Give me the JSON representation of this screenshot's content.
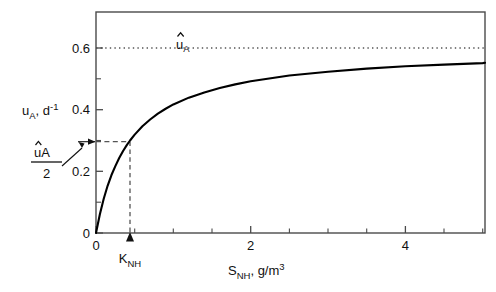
{
  "chart_data": {
    "type": "line",
    "title": "",
    "subtitle": "",
    "xlabel_main": "S",
    "xlabel_sub": "NH",
    "xlabel_rest": ", g/m",
    "xlabel_sup": "3",
    "xlabel_full": "S_NH, g/m^3",
    "ylabel_main": "u",
    "ylabel_sub": "A",
    "ylabel_rest": ", d",
    "ylabel_sup": "-1",
    "ylabel_full": "u_A, d^-1",
    "xlim": [
      0,
      5.03
    ],
    "ylim": [
      0,
      0.717
    ],
    "x_ticks": [
      0,
      2,
      4
    ],
    "x_tick_labels": [
      "0",
      "2",
      "4"
    ],
    "x_minor_ticks": [
      0.5,
      1,
      1.5,
      2.5,
      3,
      3.5,
      4.5,
      5
    ],
    "y_ticks": [
      0,
      0.2,
      0.4,
      0.6
    ],
    "y_tick_labels": [
      "0",
      "0.2",
      "0.4",
      "0.6"
    ],
    "y_minor_ticks": [
      0.1,
      0.3,
      0.5
    ],
    "grid": false,
    "legend": "none",
    "model": "Monod saturation kinetics",
    "equation": "u_A = u_hat_A * S_NH / (K_NH + S_NH)",
    "parameters": {
      "u_hat_A": 0.6,
      "K_NH": 0.44
    },
    "series": [
      {
        "name": "u_A vs S_NH (Monod curve)",
        "style": "solid",
        "color": "#000000",
        "x": [
          0,
          0.05,
          0.1,
          0.15,
          0.2,
          0.25,
          0.3,
          0.35,
          0.4,
          0.44,
          0.5,
          0.6,
          0.7,
          0.8,
          0.9,
          1.0,
          1.2,
          1.4,
          1.6,
          1.8,
          2.0,
          2.5,
          3.0,
          3.5,
          4.0,
          4.5,
          5.0,
          5.03
        ],
        "y": [
          0,
          0.061,
          0.111,
          0.153,
          0.188,
          0.217,
          0.243,
          0.266,
          0.286,
          0.3,
          0.319,
          0.346,
          0.368,
          0.387,
          0.403,
          0.417,
          0.439,
          0.456,
          0.47,
          0.482,
          0.492,
          0.511,
          0.523,
          0.533,
          0.541,
          0.546,
          0.551,
          0.552
        ]
      }
    ],
    "annotations": [
      {
        "name": "u-hat-A-asymptote",
        "text_main": "u",
        "text_sub": "A",
        "text_full": "u_hat_A",
        "has_hat": true,
        "line_style": "dotted",
        "y_value": 0.6,
        "x_from": 0,
        "x_to": 5.03,
        "label_x": 1.1
      },
      {
        "name": "half-saturation-horizontal",
        "line_style": "dashed",
        "y_value": 0.3,
        "x_from": 0,
        "x_to": 0.44
      },
      {
        "name": "half-saturation-vertical",
        "line_style": "dashed",
        "x_value": 0.44,
        "y_from": 0,
        "y_to": 0.3
      },
      {
        "name": "half-max-rate-label",
        "numerator_main": "uA",
        "numerator_full": "u_hat_A",
        "denominator": "2",
        "has_hat": true,
        "pointer": "arrow-to-y-axis-at-0.3"
      },
      {
        "name": "k-nh-axis-label",
        "text_main": "K",
        "text_sub": "NH",
        "text_full": "K_NH",
        "x_value": 0.44,
        "pointer": "arrow-up-to-x-axis"
      }
    ]
  },
  "colors": {
    "curve": "#000000",
    "axis": "#4a4a4a",
    "dashed": "#555555",
    "dotted": "#555555",
    "text": "#111111",
    "background": "#ffffff"
  }
}
